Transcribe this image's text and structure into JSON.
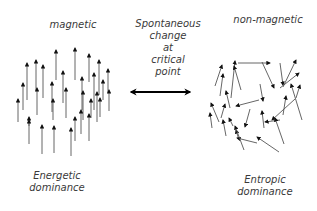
{
  "diagram": {
    "left_state": {
      "title": "magnetic",
      "caption_line1": "Energetic",
      "caption_line2": "dominance",
      "description": "spins aligned upward"
    },
    "right_state": {
      "title": "non-magnetic",
      "caption_line1": "Entropic",
      "caption_line2": "dominance",
      "description": "spins randomly oriented"
    },
    "transition": {
      "line1": "Spontaneous",
      "line2": "change",
      "line3": "at",
      "line4": "critical",
      "line5": "point",
      "arrow": "double-headed-horizontal-arrow"
    },
    "colors": {
      "text": "#3a3a3a",
      "arrow_shaft": "#555555",
      "arrow_head": "#111111",
      "background": "#ffffff"
    }
  }
}
